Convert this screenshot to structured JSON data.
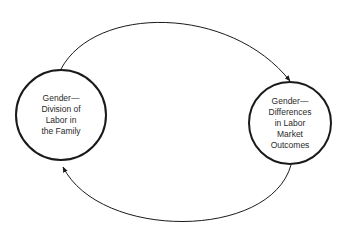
{
  "diagram": {
    "type": "cycle",
    "nodes": [
      {
        "id": "left",
        "lines": [
          "Gender—",
          "Division of",
          "Labor in",
          "the Family"
        ]
      },
      {
        "id": "right",
        "lines": [
          "Gender—",
          "Differences",
          "in Labor",
          "Market",
          "Outcomes"
        ]
      }
    ],
    "edges": [
      {
        "from": "left",
        "to": "right",
        "path": "top-arc"
      },
      {
        "from": "right",
        "to": "left",
        "path": "bottom-arc"
      }
    ],
    "colors": {
      "stroke": "#1a1a1a",
      "text": "#2a2a2a",
      "background": "#ffffff"
    }
  }
}
